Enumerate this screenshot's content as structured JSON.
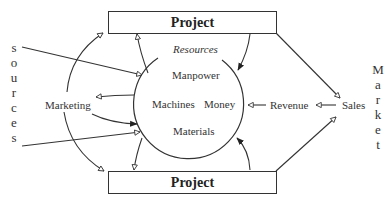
{
  "diagram": {
    "top_box": {
      "label": "Project"
    },
    "bottom_box": {
      "label": "Project"
    },
    "circle": {
      "title": "Resources",
      "items": [
        "Manpower",
        "Machines",
        "Money",
        "Materials"
      ]
    },
    "left_label": "Marketing",
    "right_labels": {
      "revenue": "Revenue",
      "sales": "Sales"
    },
    "sources_letters": [
      "s",
      "o",
      "u",
      "r",
      "c",
      "e",
      "s"
    ],
    "market_letters": [
      "M",
      "a",
      "r",
      "k",
      "e",
      "t"
    ],
    "colors": {
      "line": "#333333",
      "background": "#ffffff"
    }
  }
}
